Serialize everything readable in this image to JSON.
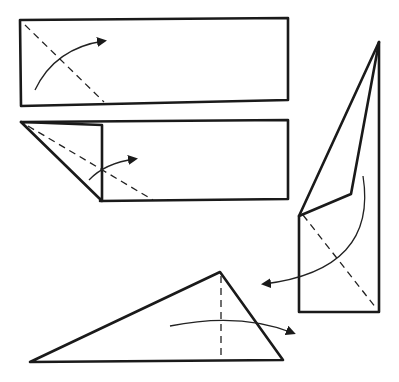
{
  "diagram": {
    "type": "origami-folding-instructions",
    "steps": [
      {
        "step": 1,
        "description": "Rectangle with diagonal dashed fold line from top-left corner; curved arrow indicates folding the corner over"
      },
      {
        "step": 2,
        "description": "Rectangle with top-left corner folded down as a triangular flap; second dashed diagonal fold line with curved arrow"
      },
      {
        "step": 3,
        "description": "Vertical narrow folded shape with pointed top; dashed diagonal fold line and curved arrow sweeping to the left"
      },
      {
        "step": 4,
        "description": "Wide obtuse triangle with vertical dashed fold line and curved arrow pointing right"
      }
    ],
    "colors": {
      "line": "#1a1a1a",
      "background": "#ffffff"
    }
  }
}
